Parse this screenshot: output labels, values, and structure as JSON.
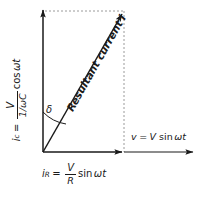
{
  "figure": {
    "type": "phasor-diagram",
    "title_visible": false,
    "background": "#ffffff",
    "stroke_color": "#1a1a1a",
    "dotted_color": "#999999",
    "width": 203,
    "height": 197
  },
  "axes": {
    "origin": {
      "x": 43,
      "y": 152
    },
    "vertical_arrow": {
      "x1": 43,
      "y1": 152,
      "x2": 43,
      "y2": 8
    },
    "horizontal_arrow": {
      "x1": 43,
      "y1": 152,
      "x2": 124,
      "y2": 152
    },
    "voltage_arrow": {
      "x1": 124,
      "y1": 152,
      "x2": 195,
      "y2": 152
    },
    "resultant_arrow": {
      "x1": 43,
      "y1": 152,
      "x2": 124,
      "y2": 12
    },
    "dotted_top": {
      "x1": 45,
      "y1": 11,
      "x2": 124,
      "y2": 11
    },
    "dotted_right": {
      "x1": 124,
      "y1": 11,
      "x2": 124,
      "y2": 152
    }
  },
  "labels": {
    "capacitive_current": {
      "name": "i_c = V / (1/omega*C) cos omega*t",
      "symbol": "i",
      "subscript": "c",
      "equals": "=",
      "numerator": "V",
      "denominator": "1/ωC",
      "function": "cos",
      "argument": "ωt",
      "plain": "i_c = V/(1/ωC) cos ωt"
    },
    "resistive_current": {
      "name": "i_R = V / R sin omega*t",
      "symbol": "i",
      "subscript": "R",
      "equals": "=",
      "numerator": "V",
      "denominator": "R",
      "function": "sin",
      "argument": "ωt",
      "plain": "i_R = V/R sin ωt"
    },
    "voltage": {
      "name": "v = V sin omega*t",
      "symbol": "v",
      "equals": "=",
      "amplitude": "V",
      "function": "sin",
      "argument": "ωt",
      "plain": "v = V sin ωt"
    },
    "resultant": {
      "text": "Resultant current",
      "symbol": "i",
      "plain": "Resultant current i"
    },
    "angle": {
      "symbol": "δ",
      "name": "phase-angle-delta"
    }
  }
}
